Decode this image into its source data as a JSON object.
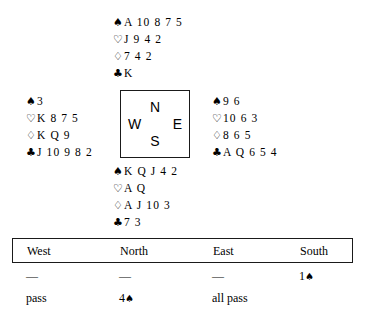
{
  "deal": {
    "north": {
      "label": "North",
      "suits": [
        {
          "icon": "spade-icon",
          "symbol": "♠",
          "cards": "A 10 8 7 5"
        },
        {
          "icon": "heart-icon",
          "symbol": "♡",
          "cards": "J 9 4 2"
        },
        {
          "icon": "diamond-icon",
          "symbol": "♢",
          "cards": "7 4 2"
        },
        {
          "icon": "club-icon",
          "symbol": "♣",
          "cards": "K"
        }
      ]
    },
    "west": {
      "label": "West",
      "suits": [
        {
          "icon": "spade-icon",
          "symbol": "♠",
          "cards": "3"
        },
        {
          "icon": "heart-icon",
          "symbol": "♡",
          "cards": "K 8 7 5"
        },
        {
          "icon": "diamond-icon",
          "symbol": "♢",
          "cards": "K Q 9"
        },
        {
          "icon": "club-icon",
          "symbol": "♣",
          "cards": "J 10 9 8 2"
        }
      ]
    },
    "east": {
      "label": "East",
      "suits": [
        {
          "icon": "spade-icon",
          "symbol": "♠",
          "cards": "9 6"
        },
        {
          "icon": "heart-icon",
          "symbol": "♡",
          "cards": "10 6 3"
        },
        {
          "icon": "diamond-icon",
          "symbol": "♢",
          "cards": "8 6 5"
        },
        {
          "icon": "club-icon",
          "symbol": "♣",
          "cards": "A Q 6 5 4"
        }
      ]
    },
    "south": {
      "label": "South",
      "suits": [
        {
          "icon": "spade-icon",
          "symbol": "♠",
          "cards": "K Q J 4 2"
        },
        {
          "icon": "heart-icon",
          "symbol": "♡",
          "cards": "A Q"
        },
        {
          "icon": "diamond-icon",
          "symbol": "♢",
          "cards": "A J 10 3"
        },
        {
          "icon": "club-icon",
          "symbol": "♣",
          "cards": "7 3"
        }
      ]
    }
  },
  "compass": {
    "north": "N",
    "west": "W",
    "east": "E",
    "south": "S"
  },
  "auction": {
    "headers": {
      "west": "West",
      "north": "North",
      "east": "East",
      "south": "South"
    },
    "rows": [
      {
        "west": "—",
        "north": "—",
        "east": "—",
        "south_level": "1",
        "south_suit": "♠"
      },
      {
        "west": "pass",
        "north_level": "4",
        "north_suit": "♠",
        "east": "all pass",
        "south": ""
      }
    ]
  },
  "colors": {
    "ink": "#000000",
    "rule": "#1a1a1a",
    "background": "#ffffff"
  }
}
